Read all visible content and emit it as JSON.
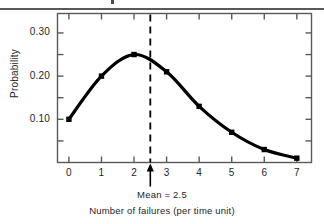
{
  "figure": {
    "name": "poisson-probability-distribution-figure",
    "has_top_rule": true
  },
  "chart_data": {
    "type": "line",
    "title": "",
    "xlabel": "Number of failures (per time unit)",
    "ylabel": "Probability",
    "x": [
      0,
      1,
      2,
      3,
      4,
      5,
      6,
      7
    ],
    "values": [
      0.1,
      0.2,
      0.25,
      0.21,
      0.13,
      0.07,
      0.03,
      0.01
    ],
    "xtick_labels": [
      "0",
      "1",
      "2",
      "3",
      "4",
      "5",
      "6",
      "7"
    ],
    "ytick_labels": [
      "0.10",
      "0.20",
      "0.30"
    ],
    "ytick_values": [
      0.1,
      0.2,
      0.3
    ],
    "xlim": [
      -0.35,
      7.45
    ],
    "ylim": [
      0,
      0.345
    ],
    "grid": false,
    "legend": null,
    "markers": "filled-square",
    "line_color": "#000000",
    "annotations": [
      {
        "name": "mean-marker",
        "label": "Mean = 2.5",
        "x": 2.5,
        "style": "dashed-vertical-line-with-up-arrow"
      }
    ]
  },
  "axis": {
    "y_title": "Probability",
    "x_title": "Number of failures (per time unit)"
  },
  "mean_annotation": {
    "label": "Mean = 2.5"
  }
}
